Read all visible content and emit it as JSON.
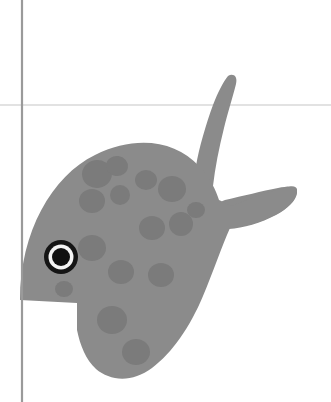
{
  "canvas": {
    "width": 331,
    "height": 402,
    "background_color": "#ffffff",
    "title": "Fish illustration"
  },
  "guides": {
    "vertical_rule": {
      "name": "vertical-guide-line",
      "x": 22,
      "y1": 0,
      "y2": 402,
      "color": "#9a9a9a",
      "width": 2.2
    },
    "horizontal_rule": {
      "name": "horizontal-guide-line",
      "y": 105,
      "x1": 0,
      "x2": 331,
      "color": "#d8d8d8",
      "width": 1.4
    }
  },
  "artwork": {
    "subject": "fish",
    "style": "flat grayscale silhouette with spots",
    "body_color": "#8b8b8b",
    "body_edge_color": "#838383",
    "spot_color": "#7b7b7b",
    "eye": {
      "name": "fish-eye",
      "center_x": 61,
      "center_y": 257,
      "outer_ring_radius": 17,
      "outer_ring_color": "#151515",
      "inner_ring_radius": 12.5,
      "inner_ring_color": "#f4f4f4",
      "pupil_radius": 9,
      "pupil_color": "#111111"
    },
    "body_path": "M 20 300 C 20 232 52 176 95 155 C 135 135 175 140 199 166 C 210 178 216 190 219 200 L 232 206 C 250 198 268 192 284 188 C 292 186 298 185 297 192 C 296 200 288 208 277 214 C 262 222 244 227 230 228 C 222 246 213 272 203 296 C 190 327 172 353 152 368 C 132 383 110 381 96 369 C 86 360 80 345 77 330 L 77 303 Z",
    "tail_upper_path": "M 228 76 C 233 73 238 76 236 84 C 233 96 228 112 224 128 C 219 148 215 168 213 186 C 211 196 206 200 202 196 C 196 190 194 178 196 166 C 199 148 206 124 213 105 C 218 92 223 82 228 76 Z",
    "tail_lower_path": "M 225 200 C 243 196 262 191 278 188 C 290 186 298 185 297 193 C 296 201 287 209 276 215 C 261 223 243 228 229 229 C 222 229 217 225 216 218 C 215 209 218 202 225 200 Z",
    "notch_path": "M 20 303 L 77 303 L 77 376 L 42 376 C 30 362 22 338 20 312 Z",
    "spots": [
      {
        "name": "spot-1",
        "cx": 97,
        "cy": 174,
        "rx": 15,
        "ry": 14,
        "rot": -10
      },
      {
        "name": "spot-2",
        "cx": 117,
        "cy": 166,
        "rx": 11,
        "ry": 10,
        "rot": 8
      },
      {
        "name": "spot-3",
        "cx": 92,
        "cy": 201,
        "rx": 13,
        "ry": 12,
        "rot": 0
      },
      {
        "name": "spot-4",
        "cx": 120,
        "cy": 195,
        "rx": 10,
        "ry": 10,
        "rot": 0
      },
      {
        "name": "spot-5",
        "cx": 146,
        "cy": 180,
        "rx": 11,
        "ry": 10,
        "rot": 0
      },
      {
        "name": "spot-6",
        "cx": 172,
        "cy": 189,
        "rx": 14,
        "ry": 13,
        "rot": 0
      },
      {
        "name": "spot-7",
        "cx": 152,
        "cy": 228,
        "rx": 13,
        "ry": 12,
        "rot": 0
      },
      {
        "name": "spot-8",
        "cx": 181,
        "cy": 224,
        "rx": 12,
        "ry": 12,
        "rot": 0
      },
      {
        "name": "spot-9",
        "cx": 92,
        "cy": 248,
        "rx": 14,
        "ry": 13,
        "rot": 0
      },
      {
        "name": "spot-10",
        "cx": 121,
        "cy": 272,
        "rx": 13,
        "ry": 12,
        "rot": 0
      },
      {
        "name": "spot-11",
        "cx": 161,
        "cy": 275,
        "rx": 13,
        "ry": 12,
        "rot": 0
      },
      {
        "name": "spot-12",
        "cx": 112,
        "cy": 320,
        "rx": 15,
        "ry": 14,
        "rot": 0
      },
      {
        "name": "spot-13",
        "cx": 136,
        "cy": 352,
        "rx": 14,
        "ry": 13,
        "rot": 0
      },
      {
        "name": "spot-14",
        "cx": 64,
        "cy": 289,
        "rx": 9,
        "ry": 8,
        "rot": 0
      },
      {
        "name": "spot-15",
        "cx": 196,
        "cy": 210,
        "rx": 9,
        "ry": 8,
        "rot": 0
      }
    ]
  }
}
